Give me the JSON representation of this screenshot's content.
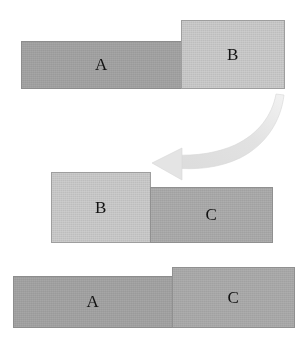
{
  "diagram": {
    "background_color": "#ffffff",
    "colors": {
      "dark_gray": "#a6a6a6",
      "light_gray": "#cdcdcd",
      "medium_gray": "#aeaeae",
      "arrow_gray": "#e4e4e4",
      "border_gray": "#787878",
      "label_text": "#111111"
    },
    "rows": [
      {
        "row_name": "row-top",
        "blocks": [
          {
            "label": "A",
            "shade": "dark_gray",
            "color": "#a6a6a6"
          },
          {
            "label": "B",
            "shade": "light_gray",
            "color": "#cdcdcd"
          }
        ]
      },
      {
        "row_name": "row-middle",
        "blocks": [
          {
            "label": "B",
            "shade": "light_gray",
            "color": "#cdcdcd"
          },
          {
            "label": "C",
            "shade": "medium_gray",
            "color": "#aeaeae"
          }
        ]
      },
      {
        "row_name": "row-bottom",
        "blocks": [
          {
            "label": "A",
            "shade": "dark_gray",
            "color": "#a6a6a6"
          },
          {
            "label": "C",
            "shade": "medium_gray",
            "color": "#aeaeae"
          }
        ]
      }
    ],
    "arrow": {
      "name": "curved-swoosh-arrow",
      "direction": "right-to-left-downward",
      "color": "#e4e4e4",
      "points_to": "row-middle"
    }
  }
}
